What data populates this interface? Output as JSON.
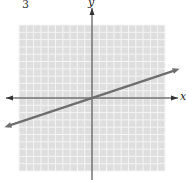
{
  "problem": {
    "number": "3"
  },
  "chart_data": {
    "type": "line",
    "title": "",
    "xlabel": "x",
    "ylabel": "y",
    "xlim": [
      -10,
      10
    ],
    "ylim": [
      -10,
      10
    ],
    "grid": true,
    "series": [
      {
        "name": "line",
        "equation": "y = (1/3)x",
        "slope": 0.3333,
        "intercept": 0,
        "x": [
          -12,
          12
        ],
        "y": [
          -4,
          4
        ]
      }
    ],
    "colors": {
      "grid_bg": "#dedede",
      "grid_line": "#f4f4f4",
      "axis": "#333333",
      "line": "#6e6e6e"
    }
  }
}
